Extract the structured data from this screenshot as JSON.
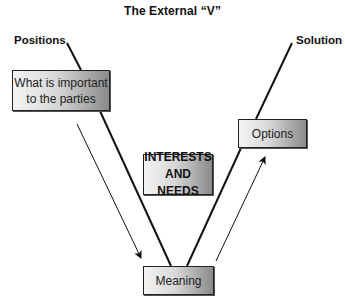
{
  "diagram": {
    "title": "The External “V”",
    "labels": {
      "top_left": "Positions",
      "top_right": "Solution"
    },
    "boxes": {
      "important": "What is important to the parties",
      "important_line1": "What is important",
      "important_line2": "to the parties",
      "interests_line1": "INTERESTS",
      "interests_line2": "AND NEEDS",
      "meaning": "Meaning",
      "options": "Options"
    },
    "flow": [
      {
        "from": "What is important to the parties",
        "to": "Meaning",
        "type": "arrow"
      },
      {
        "from": "Meaning",
        "to": "Options",
        "type": "arrow"
      }
    ],
    "colors": {
      "line": "#111111",
      "box_border": "#222222",
      "box_gradient_start": "#f4f4f4",
      "box_gradient_end": "#8a8a8a"
    }
  }
}
